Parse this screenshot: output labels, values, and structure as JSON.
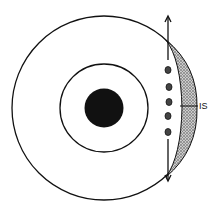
{
  "diagram": {
    "type": "concentric-circles-cross-section",
    "label": "IS",
    "colors": {
      "line": "#111111",
      "background": "#ffffff",
      "core": "#111111",
      "stipple": "#555555"
    },
    "parts": [
      {
        "name": "outer-circle"
      },
      {
        "name": "middle-circle"
      },
      {
        "name": "core-disk"
      },
      {
        "name": "stippled-crescent"
      },
      {
        "name": "vertical-arrow"
      },
      {
        "name": "dots",
        "count": 5
      }
    ]
  }
}
